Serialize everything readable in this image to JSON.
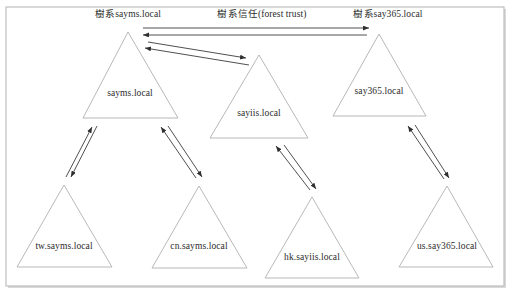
{
  "figure": {
    "type": "active-directory-forest-trust-diagram",
    "frame": {
      "border_color": "#b9b9b9",
      "shadow_color": "#d9d9d9",
      "background": "#ffffff"
    },
    "stroke_colors": {
      "triangle": "#b0b0b0",
      "arrow": "#2f2f2f",
      "text": "#2b2b2b"
    }
  },
  "forest_labels": [
    {
      "id": "forest-sayms",
      "text": "樹系sayms.local",
      "x": 128,
      "y": 10
    },
    {
      "id": "forest-say365",
      "text": "樹系say365.local",
      "x": 388,
      "y": 10
    }
  ],
  "trust_label": {
    "id": "forest-trust-label",
    "text": "樹系信任(forest trust)",
    "x": 262,
    "y": 10
  },
  "domains": [
    {
      "id": "sayms-local",
      "label": "sayms.local",
      "role": "forest-root-domain",
      "apex": {
        "x": 128,
        "y": 32
      },
      "left": {
        "x": 83,
        "y": 118
      },
      "right": {
        "x": 178,
        "y": 118
      },
      "label_pos": {
        "x": 130,
        "y": 94
      }
    },
    {
      "id": "sayiis-local",
      "label": "sayiis.local",
      "role": "tree-root-domain",
      "apex": {
        "x": 259,
        "y": 55
      },
      "left": {
        "x": 210,
        "y": 138
      },
      "right": {
        "x": 308,
        "y": 138
      },
      "label_pos": {
        "x": 259,
        "y": 114
      }
    },
    {
      "id": "say365-local",
      "label": "say365.local",
      "role": "forest-root-domain",
      "apex": {
        "x": 379,
        "y": 34
      },
      "left": {
        "x": 333,
        "y": 116
      },
      "right": {
        "x": 426,
        "y": 116
      },
      "label_pos": {
        "x": 379,
        "y": 92
      }
    },
    {
      "id": "tw-sayms-local",
      "label": "tw.sayms.local",
      "role": "child-domain",
      "apex": {
        "x": 64,
        "y": 185
      },
      "left": {
        "x": 17,
        "y": 267
      },
      "right": {
        "x": 112,
        "y": 267
      },
      "label_pos": {
        "x": 64,
        "y": 247
      }
    },
    {
      "id": "cn-sayms-local",
      "label": "cn.sayms.local",
      "role": "child-domain",
      "apex": {
        "x": 199,
        "y": 186
      },
      "left": {
        "x": 152,
        "y": 268
      },
      "right": {
        "x": 247,
        "y": 268
      },
      "label_pos": {
        "x": 199,
        "y": 247
      }
    },
    {
      "id": "hk-sayiis-local",
      "label": "hk.sayiis.local",
      "role": "child-domain",
      "apex": {
        "x": 312,
        "y": 197
      },
      "left": {
        "x": 265,
        "y": 278
      },
      "right": {
        "x": 359,
        "y": 278
      },
      "label_pos": {
        "x": 312,
        "y": 258
      }
    },
    {
      "id": "us-say365-local",
      "label": "us.say365.local",
      "role": "child-domain",
      "apex": {
        "x": 447,
        "y": 186
      },
      "left": {
        "x": 399,
        "y": 267
      },
      "right": {
        "x": 493,
        "y": 267
      },
      "label_pos": {
        "x": 447,
        "y": 247
      }
    }
  ],
  "arrows": [
    {
      "id": "trust-sayms-to-say365",
      "from": "sayms-local",
      "to": "say365-local",
      "kind": "forest-trust",
      "x1": 143,
      "y1": 28,
      "x2": 369,
      "y2": 28
    },
    {
      "id": "trust-say365-to-sayms",
      "from": "say365-local",
      "to": "sayms-local",
      "kind": "forest-trust",
      "x1": 367,
      "y1": 35,
      "x2": 143,
      "y2": 35
    },
    {
      "id": "trust-sayms-to-sayiis",
      "from": "sayms-local",
      "to": "sayiis-local",
      "kind": "tree-root-trust",
      "x1": 148,
      "y1": 42,
      "x2": 246,
      "y2": 58
    },
    {
      "id": "trust-sayiis-to-sayms",
      "from": "sayiis-local",
      "to": "sayms-local",
      "kind": "tree-root-trust",
      "x1": 249,
      "y1": 65,
      "x2": 145,
      "y2": 48
    },
    {
      "id": "trust-tw-to-sayms",
      "from": "tw-sayms-local",
      "to": "sayms-local",
      "kind": "parent-child-trust",
      "x1": 66,
      "y1": 177,
      "x2": 92,
      "y2": 127
    },
    {
      "id": "trust-sayms-to-tw",
      "from": "sayms-local",
      "to": "tw-sayms-local",
      "kind": "parent-child-trust",
      "x1": 97,
      "y1": 126,
      "x2": 71,
      "y2": 177
    },
    {
      "id": "trust-cn-to-sayms",
      "from": "cn-sayms-local",
      "to": "sayms-local",
      "kind": "parent-child-trust",
      "x1": 196,
      "y1": 178,
      "x2": 161,
      "y2": 127
    },
    {
      "id": "trust-sayms-to-cn",
      "from": "sayms-local",
      "to": "cn-sayms-local",
      "kind": "parent-child-trust",
      "x1": 168,
      "y1": 126,
      "x2": 202,
      "y2": 177
    },
    {
      "id": "trust-hk-to-sayiis",
      "from": "hk-sayiis-local",
      "to": "sayiis-local",
      "kind": "parent-child-trust",
      "x1": 310,
      "y1": 190,
      "x2": 276,
      "y2": 146
    },
    {
      "id": "trust-sayiis-to-hk",
      "from": "sayiis-local",
      "to": "hk-sayiis-local",
      "kind": "parent-child-trust",
      "x1": 284,
      "y1": 145,
      "x2": 316,
      "y2": 189
    },
    {
      "id": "trust-us-to-say365",
      "from": "us-say365-local",
      "to": "say365-local",
      "kind": "parent-child-trust",
      "x1": 444,
      "y1": 179,
      "x2": 408,
      "y2": 126
    },
    {
      "id": "trust-say365-to-us",
      "from": "say365-local",
      "to": "us-say365-local",
      "kind": "parent-child-trust",
      "x1": 415,
      "y1": 125,
      "x2": 449,
      "y2": 178
    }
  ]
}
